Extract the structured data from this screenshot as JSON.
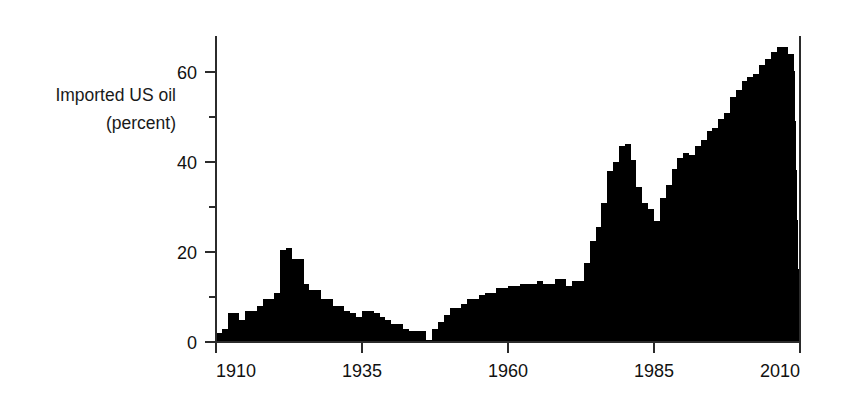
{
  "chart_data": {
    "type": "bar",
    "title": "",
    "subtitle": "",
    "ylabel_line1": "Imported US oil",
    "ylabel_line2": "(percent)",
    "xlabel": "",
    "xlim": [
      1910,
      2010
    ],
    "ylim": [
      0,
      68
    ],
    "grid": false,
    "legend": null,
    "xticks": [
      1910,
      1935,
      1960,
      1985,
      2010
    ],
    "xtick_labels": [
      "1910",
      "1935",
      "1960",
      "1985",
      "2010"
    ],
    "yticks": [
      0,
      20,
      40,
      60
    ],
    "ytick_labels": [
      "0",
      "20",
      "40",
      "60"
    ],
    "yticks_minor": [
      10,
      30,
      50,
      70
    ],
    "bar_color": "#000000",
    "x": [
      1910,
      1911,
      1912,
      1913,
      1914,
      1915,
      1916,
      1917,
      1918,
      1919,
      1920,
      1921,
      1922,
      1923,
      1924,
      1925,
      1926,
      1927,
      1928,
      1929,
      1930,
      1931,
      1932,
      1933,
      1934,
      1935,
      1936,
      1937,
      1938,
      1939,
      1940,
      1941,
      1942,
      1943,
      1944,
      1945,
      1946,
      1947,
      1948,
      1949,
      1950,
      1951,
      1952,
      1953,
      1954,
      1955,
      1956,
      1957,
      1958,
      1959,
      1960,
      1961,
      1962,
      1963,
      1964,
      1965,
      1966,
      1967,
      1968,
      1969,
      1970,
      1971,
      1972,
      1973,
      1974,
      1975,
      1976,
      1977,
      1978,
      1979,
      1980,
      1981,
      1982,
      1983,
      1984,
      1985,
      1986,
      1987,
      1988,
      1989,
      1990,
      1991,
      1992,
      1993,
      1994,
      1995,
      1996,
      1997,
      1998,
      1999,
      2000,
      2001,
      2002,
      2003,
      2004,
      2005,
      2006,
      2007,
      2008
    ],
    "values": [
      2.0,
      3.0,
      6.5,
      6.5,
      5.0,
      7.0,
      7.0,
      8.0,
      9.5,
      9.5,
      11.0,
      20.5,
      21.0,
      18.5,
      18.5,
      13.0,
      11.5,
      11.5,
      9.5,
      9.5,
      8.0,
      8.0,
      7.0,
      6.5,
      5.5,
      7.0,
      7.0,
      6.5,
      5.5,
      5.0,
      4.0,
      4.0,
      3.0,
      2.5,
      2.5,
      2.5,
      0.5,
      3.0,
      4.5,
      6.0,
      7.5,
      7.5,
      8.5,
      9.5,
      9.5,
      10.5,
      11.0,
      11.0,
      12.0,
      12.0,
      12.5,
      12.5,
      13.0,
      13.0,
      13.0,
      13.5,
      13.0,
      13.0,
      14.0,
      14.0,
      12.5,
      13.5,
      13.5,
      17.5,
      22.5,
      25.5,
      31.0,
      38.0,
      40.0,
      43.5,
      44.0,
      40.5,
      34.5,
      31.0,
      29.5,
      27.0,
      32.0,
      35.0,
      38.5,
      41.0,
      42.0,
      41.5,
      43.5,
      45.0,
      47.0,
      47.5,
      49.5,
      51.0,
      54.5,
      56.0,
      58.0,
      59.0,
      59.5,
      61.5,
      63.0,
      64.5,
      65.5,
      65.5,
      64.0
    ]
  },
  "axis": {
    "y_label_line1": "Imported US oil",
    "y_label_line2": "(percent)"
  }
}
